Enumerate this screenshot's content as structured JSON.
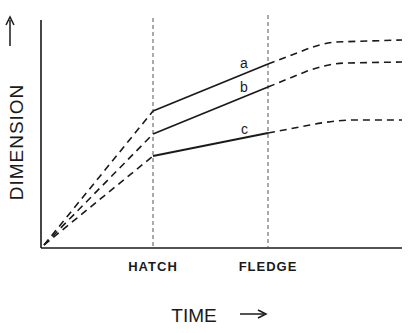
{
  "diagram": {
    "type": "growth-curve-schematic",
    "y_axis": {
      "label": "DIMENSION",
      "arrow": "→"
    },
    "x_axis": {
      "label": "TIME",
      "arrow": "→"
    },
    "events": [
      {
        "label": "HATCH",
        "x": 153
      },
      {
        "label": "FLEDGE",
        "x": 268
      }
    ],
    "curves": [
      {
        "label": "a",
        "at_hatch_y": 111,
        "at_fledge_y": 64,
        "plateau_y": 40
      },
      {
        "label": "b",
        "at_hatch_y": 134,
        "at_fledge_y": 87,
        "plateau_y": 62
      },
      {
        "label": "c",
        "at_hatch_y": 156,
        "at_fledge_y": 133,
        "plateau_y": 120
      }
    ],
    "line_color": "#1a1a1a",
    "guide_color": "#555555"
  }
}
